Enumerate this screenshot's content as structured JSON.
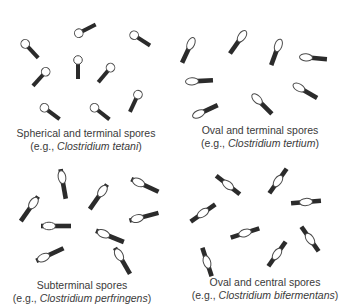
{
  "colors": {
    "rod": "#2b2b2b",
    "spore_stroke": "#4a4a4a",
    "spore_fill": "#ffffff",
    "text": "#3a3a3a"
  },
  "panels": [
    {
      "id": "spherical-terminal",
      "title": "Spherical and terminal spores",
      "example_prefix": "(e.g., ",
      "example_species": "Clostridium tetani",
      "example_suffix": ")",
      "spore_shape": "spherical",
      "spore_position": "terminal",
      "cells": [
        {
          "x": 30,
          "y": 49,
          "angle": 47
        },
        {
          "x": 85,
          "y": 30,
          "angle": -27
        },
        {
          "x": 140,
          "y": 39,
          "angle": 33
        },
        {
          "x": 78,
          "y": 67,
          "angle": 90
        },
        {
          "x": 41,
          "y": 77,
          "angle": 132
        },
        {
          "x": 106,
          "y": 73,
          "angle": 130
        },
        {
          "x": 50,
          "y": 112,
          "angle": 37
        },
        {
          "x": 100,
          "y": 112,
          "angle": 38
        },
        {
          "x": 135,
          "y": 101,
          "angle": 115
        }
      ]
    },
    {
      "id": "oval-terminal",
      "title": "Oval and terminal spores",
      "example_prefix": "(e.g., ",
      "example_species": "Clostridium tertium",
      "example_suffix": ")",
      "spore_shape": "oval",
      "spore_position": "terminal",
      "cells": [
        {
          "x": 188,
          "y": 50,
          "angle": 115
        },
        {
          "x": 238,
          "y": 42,
          "angle": 125
        },
        {
          "x": 276,
          "y": 52,
          "angle": 110
        },
        {
          "x": 313,
          "y": 58,
          "angle": 5
        },
        {
          "x": 199,
          "y": 81,
          "angle": -3
        },
        {
          "x": 305,
          "y": 91,
          "angle": 30
        },
        {
          "x": 262,
          "y": 104,
          "angle": 45
        },
        {
          "x": 205,
          "y": 111,
          "angle": -25
        }
      ]
    },
    {
      "id": "subterminal",
      "title": "Subterminal spores",
      "example_prefix": "(e.g., ",
      "example_species": "Clostridium perfringens",
      "example_suffix": ")",
      "spore_shape": "oval",
      "spore_position": "subterminal",
      "cells": [
        {
          "x": 63,
          "y": 183,
          "angle": 80
        },
        {
          "x": 30,
          "y": 208,
          "angle": 125
        },
        {
          "x": 99,
          "y": 196,
          "angle": 125
        },
        {
          "x": 144,
          "y": 185,
          "angle": 25
        },
        {
          "x": 55,
          "y": 226,
          "angle": 0
        },
        {
          "x": 143,
          "y": 217,
          "angle": -15
        },
        {
          "x": 109,
          "y": 236,
          "angle": 22
        },
        {
          "x": 49,
          "y": 255,
          "angle": -25
        },
        {
          "x": 122,
          "y": 260,
          "angle": 60
        }
      ]
    },
    {
      "id": "oval-central",
      "title": "Oval and central spores",
      "example_prefix": "(e.g., ",
      "example_species": "Clostridium bifermentans",
      "example_suffix": ")",
      "spore_shape": "oval",
      "spore_position": "central",
      "cells": [
        {
          "x": 228,
          "y": 185,
          "angle": 38
        },
        {
          "x": 278,
          "y": 181,
          "angle": -55
        },
        {
          "x": 306,
          "y": 202,
          "angle": -5
        },
        {
          "x": 203,
          "y": 213,
          "angle": -35
        },
        {
          "x": 245,
          "y": 233,
          "angle": -18
        },
        {
          "x": 310,
          "y": 239,
          "angle": 55
        },
        {
          "x": 277,
          "y": 254,
          "angle": -55
        },
        {
          "x": 207,
          "y": 262,
          "angle": 72
        }
      ]
    }
  ],
  "captions": [
    {
      "x": 86,
      "y": 127
    },
    {
      "x": 260,
      "y": 124
    },
    {
      "x": 82,
      "y": 279
    },
    {
      "x": 265,
      "y": 276
    }
  ]
}
